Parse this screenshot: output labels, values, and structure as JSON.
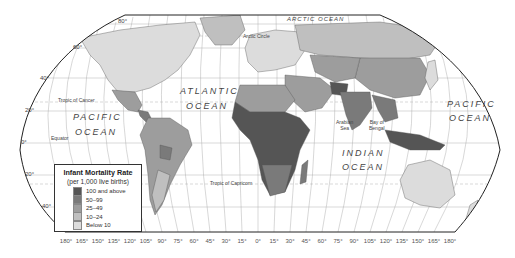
{
  "map": {
    "title": "Infant Mortality Rate",
    "projection_outline": "rounded pseudo-cylindrical world map",
    "oceans": [
      {
        "name": "PACIFIC",
        "line2": "OCEAN",
        "pos": "west"
      },
      {
        "name": "ATLANTIC",
        "line2": "OCEAN",
        "pos": "atlantic"
      },
      {
        "name": "INDIAN",
        "line2": "OCEAN",
        "pos": "indian"
      },
      {
        "name": "PACIFIC",
        "line2": "OCEAN",
        "pos": "east"
      },
      {
        "name": "ARCTIC OCEAN",
        "pos": "arctic"
      }
    ],
    "features": {
      "arctic_circle": "Arctic Circle",
      "tropic_cancer": "Tropic of Cancer",
      "equator": "Equator",
      "tropic_capricorn": "Tropic of Capricorn",
      "arabian_sea": [
        "Arabian",
        "Sea"
      ],
      "bay_of_bengal": [
        "Bay of",
        "Bengal"
      ]
    },
    "latitude_labels": [
      "80°",
      "60°",
      "40°",
      "20°",
      "0°",
      "20°",
      "40°"
    ],
    "longitude_labels": [
      "180°",
      "165°",
      "150°",
      "135°",
      "120°",
      "105°",
      "90°",
      "75°",
      "60°",
      "45°",
      "30°",
      "15°",
      "0°",
      "15°",
      "30°",
      "45°",
      "60°",
      "75°",
      "90°",
      "105°",
      "120°",
      "135°",
      "150°",
      "165°",
      "180°"
    ]
  },
  "legend": {
    "title": "Infant Mortality Rate",
    "subtitle": "(per 1,000 live births)",
    "items": [
      {
        "label": "100 and above",
        "color": "#555555"
      },
      {
        "label": "50–99",
        "color": "#7a7a7a"
      },
      {
        "label": "25–49",
        "color": "#9d9d9d"
      },
      {
        "label": "10–24",
        "color": "#bfbfbf"
      },
      {
        "label": "Below 10",
        "color": "#dcdcdc"
      }
    ]
  },
  "colors": {
    "land_below10": "#dcdcdc",
    "land_10_24": "#bfbfbf",
    "land_25_49": "#9d9d9d",
    "land_50_99": "#7a7a7a",
    "land_100plus": "#555555",
    "grid": "#999999",
    "outline": "#222222"
  }
}
